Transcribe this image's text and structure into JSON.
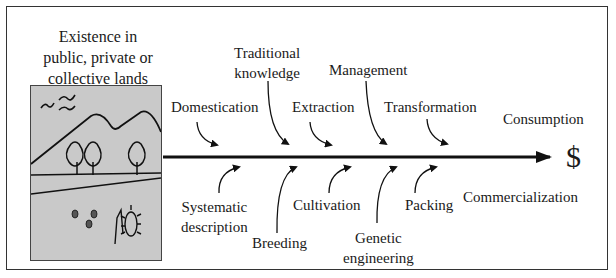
{
  "diagram": {
    "source_label": "Existence in public, private or collective lands",
    "source_label_lines": [
      "Existence in",
      "public, private or",
      "collective lands"
    ],
    "end_symbol": "$",
    "end_labels": {
      "top": "Consumption",
      "bottom": "Commercialization"
    },
    "top_steps": [
      {
        "label": "Domestication"
      },
      {
        "label_lines": [
          "Traditional",
          "knowledge"
        ]
      },
      {
        "label": "Extraction"
      },
      {
        "label": "Management"
      },
      {
        "label": "Transformation"
      }
    ],
    "bottom_steps": [
      {
        "label_lines": [
          "Systematic",
          "description"
        ]
      },
      {
        "label": "Breeding"
      },
      {
        "label": "Cultivation"
      },
      {
        "label_lines": [
          "Genetic",
          "engineering"
        ]
      },
      {
        "label": "Packing"
      }
    ],
    "icons": {
      "landscape": "landscape-illustration-icon",
      "birds": "birds-icon",
      "mountains": "mountains-icon",
      "trees": "trees-icon",
      "seeds": "seeds-icon",
      "plant": "plant-icon",
      "main_arrow": "arrow-right-icon"
    },
    "colors": {
      "line": "#111111",
      "picture_bg": "#c9c9c9",
      "border": "#333333"
    }
  }
}
